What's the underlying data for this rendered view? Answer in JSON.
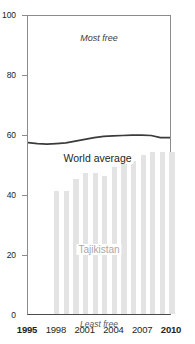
{
  "chart_data": {
    "type": "bar",
    "title": "",
    "xlabel": "",
    "ylabel": "",
    "ylim": [
      0,
      100
    ],
    "xlim": [
      1995,
      2010
    ],
    "grid": false,
    "legend_position": "inline-annotation",
    "categories": [
      1995,
      1996,
      1997,
      1998,
      1999,
      2000,
      2001,
      2002,
      2003,
      2004,
      2005,
      2006,
      2007,
      2008,
      2009,
      2010
    ],
    "series": [
      {
        "name": "Tajikistan",
        "type": "bar",
        "color": "#e3e3e3",
        "values": [
          null,
          null,
          null,
          41,
          41,
          45,
          47,
          47,
          46,
          49,
          50,
          51,
          53,
          54,
          54,
          54
        ]
      },
      {
        "name": "World average",
        "type": "line",
        "color": "#3b3b3b",
        "values": [
          57.5,
          57.2,
          57.0,
          57.2,
          57.4,
          58.0,
          58.6,
          59.2,
          59.6,
          59.8,
          59.9,
          60.0,
          60.0,
          59.9,
          59.2,
          59.2
        ]
      }
    ],
    "annotations": [
      {
        "name": "most-free",
        "text": "Most free",
        "position": "top-center",
        "style": "italic"
      },
      {
        "name": "least-free",
        "text": "Least free",
        "position": "bottom-center",
        "style": "italic"
      },
      {
        "name": "world-average",
        "text": "World average",
        "position": "inline-above-line"
      },
      {
        "name": "country",
        "text": "Tajikistan",
        "position": "inline-over-bars"
      }
    ],
    "yticks": [
      0,
      20,
      40,
      60,
      80,
      100
    ],
    "ytick_labels": [
      "0",
      "20",
      "40",
      "60",
      "80",
      "100"
    ],
    "xticks": [
      1995,
      1998,
      2001,
      2004,
      2007,
      2010
    ],
    "xtick_labels": [
      "1995",
      "1998",
      "2001",
      "2004",
      "2007",
      "2010"
    ],
    "xtick_bold": [
      true,
      false,
      false,
      false,
      false,
      true
    ]
  },
  "labels": {
    "most_free": "Most free",
    "least_free": "Least free",
    "world_average": "World average",
    "country": "Tajikistan"
  },
  "colors": {
    "bar": "#e3e3e3",
    "line": "#3b3b3b",
    "axis": "#8c8c8c",
    "text": "#231f20",
    "country_label": "#a8a8a8"
  }
}
